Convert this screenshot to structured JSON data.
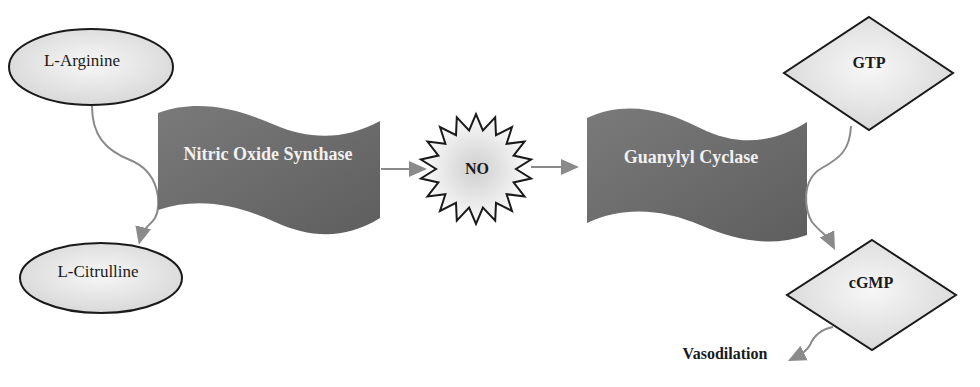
{
  "caption": "Figure: the nitric oxide pathway (partially visible header text)",
  "nodes": {
    "l_arginine": {
      "label": "L-Arginine"
    },
    "l_citrulline": {
      "label": "L-Citrulline"
    },
    "nos": {
      "label": "Nitric Oxide Synthase"
    },
    "no": {
      "label": "NO"
    },
    "guanylyl_cyclase": {
      "label": "Guanylyl Cyclase"
    },
    "gtp": {
      "label": "GTP"
    },
    "cgmp": {
      "label": "cGMP"
    },
    "vasodilation": {
      "label": "Vasodilation"
    }
  },
  "colors": {
    "banner": "#6e6e6e",
    "node_fill": "#e6e6e6",
    "stroke": "#1a1a1a",
    "arrow": "#8a8a8a"
  }
}
